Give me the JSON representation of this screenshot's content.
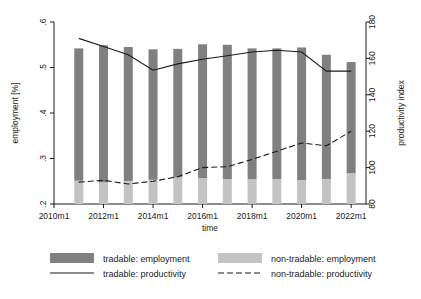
{
  "chart_data": {
    "type": "bar",
    "title": "",
    "xlabel": "time",
    "ylabel": "employment [%]",
    "y2label": "productivity index",
    "categories": [
      "2011m1",
      "2012m1",
      "2013m1",
      "2014m1",
      "2015m1",
      "2016m1",
      "2017m1",
      "2018m1",
      "2019m1",
      "2020m1",
      "2021m1",
      "2022m1"
    ],
    "x": [
      2011,
      2012,
      2013,
      2014,
      2015,
      2016,
      2017,
      2018,
      2019,
      2020,
      2021,
      2022
    ],
    "xlim": [
      2010,
      2022.6
    ],
    "ylim": [
      0.2,
      0.6
    ],
    "y2lim": [
      80,
      180
    ],
    "xticks": [
      "2010m1",
      "2012m1",
      "2014m1",
      "2016m1",
      "2018m1",
      "2020m1",
      "2022m1"
    ],
    "xtick_values": [
      2010,
      2012,
      2014,
      2016,
      2018,
      2020,
      2022
    ],
    "yticks": [
      ".2",
      ".3",
      ".4",
      ".5",
      ".6"
    ],
    "ytick_values": [
      0.2,
      0.3,
      0.4,
      0.5,
      0.6
    ],
    "y2ticks": [
      "80",
      "100",
      "120",
      "140",
      "160",
      "180"
    ],
    "y2tick_values": [
      80,
      100,
      120,
      140,
      160,
      180
    ],
    "grid": false,
    "legend_position": "bottom",
    "stacked": true,
    "series": [
      {
        "name": "tradable: employment",
        "kind": "bar",
        "axis": "left",
        "color": "#808080",
        "values": [
          0.291,
          0.302,
          0.295,
          0.287,
          0.283,
          0.294,
          0.296,
          0.288,
          0.288,
          0.292,
          0.273,
          0.245
        ]
      },
      {
        "name": "non-tradable: employment",
        "kind": "bar",
        "axis": "left",
        "color": "#c3c3c3",
        "values": [
          0.251,
          0.247,
          0.25,
          0.253,
          0.258,
          0.257,
          0.254,
          0.254,
          0.254,
          0.252,
          0.255,
          0.267
        ]
      },
      {
        "name": "tradable: productivity",
        "kind": "line",
        "axis": "right",
        "style": "solid",
        "color": "#1a1a1a",
        "values": [
          171.0,
          166.5,
          162.0,
          153.5,
          157.0,
          159.5,
          161.5,
          163.5,
          164.5,
          163.5,
          153.0,
          153.0
        ]
      },
      {
        "name": "non-tradable: productivity",
        "kind": "line",
        "axis": "right",
        "style": "dashed",
        "color": "#1a1a1a",
        "values": [
          92.0,
          93.0,
          91.0,
          92.5,
          95.0,
          100.0,
          100.5,
          104.5,
          109.0,
          113.5,
          112.0,
          120.0
        ]
      }
    ],
    "legend": [
      {
        "label": "tradable: employment",
        "marker": "swatch",
        "color": "#808080"
      },
      {
        "label": "non-tradable: employment",
        "marker": "swatch",
        "color": "#c3c3c3"
      },
      {
        "label": "tradable: productivity",
        "marker": "solid-line",
        "color": "#1a1a1a"
      },
      {
        "label": "non-tradable: productivity",
        "marker": "dashed-line",
        "color": "#1a1a1a"
      }
    ]
  }
}
